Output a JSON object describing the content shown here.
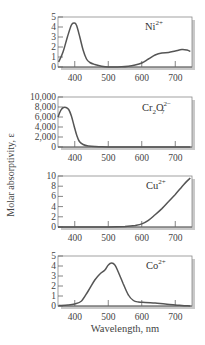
{
  "figure": {
    "ylabel": "Molar absorptivity, ε",
    "xlabel": "Wavelength, nm"
  },
  "chart_data": [
    {
      "type": "line",
      "title": "Ni2+",
      "label_main": "Ni",
      "label_sup": "2+",
      "label_sub": "",
      "xlabel": "Wavelength, nm",
      "ylabel": "Molar absorptivity, ε",
      "xlim": [
        350,
        750
      ],
      "ylim": [
        0,
        5
      ],
      "xticks": [
        400,
        500,
        600,
        700
      ],
      "yticks": [
        0,
        1,
        2,
        3,
        4,
        5
      ],
      "ytick_labels": [
        "0",
        "1",
        "2",
        "3",
        "4",
        "5"
      ],
      "x": [
        352,
        365,
        378,
        390,
        398,
        405,
        415,
        425,
        435,
        445,
        460,
        480,
        500,
        520,
        540,
        560,
        580,
        600,
        620,
        640,
        660,
        680,
        700,
        720,
        735,
        745
      ],
      "y": [
        0.5,
        1.5,
        3.0,
        4.2,
        4.4,
        4.2,
        3.0,
        1.7,
        0.8,
        0.45,
        0.25,
        0.08,
        0.0,
        0.0,
        0.02,
        0.08,
        0.2,
        0.4,
        0.8,
        1.2,
        1.4,
        1.45,
        1.6,
        1.75,
        1.7,
        1.55
      ]
    },
    {
      "type": "line",
      "title": "Cr2O7 2-",
      "label_main": "Cr",
      "label_sup": "2−",
      "label_sub": "2",
      "label_mid": "O",
      "label_sub2": "7",
      "xlabel": "Wavelength, nm",
      "ylabel": "Molar absorptivity, ε",
      "xlim": [
        350,
        750
      ],
      "ylim": [
        0,
        10000
      ],
      "xticks": [
        400,
        500,
        600,
        700
      ],
      "yticks": [
        0,
        2000,
        4000,
        6000,
        8000,
        10000
      ],
      "ytick_labels": [
        "0",
        "2,000",
        "4,000",
        "6,000",
        "8,000",
        "10,000"
      ],
      "x": [
        350,
        358,
        366,
        374,
        382,
        390,
        398,
        406,
        414,
        425,
        440,
        460,
        480,
        500,
        550,
        600,
        650,
        700,
        745
      ],
      "y": [
        6000,
        7300,
        7900,
        7900,
        7500,
        6200,
        4200,
        2300,
        1100,
        500,
        200,
        80,
        30,
        10,
        0,
        0,
        0,
        0,
        0
      ]
    },
    {
      "type": "line",
      "title": "Cu2+",
      "label_main": "Cu",
      "label_sup": "2+",
      "label_sub": "",
      "xlabel": "Wavelength, nm",
      "ylabel": "Molar absorptivity, ε",
      "xlim": [
        350,
        750
      ],
      "ylim": [
        0,
        10
      ],
      "xticks": [
        400,
        500,
        600,
        700
      ],
      "yticks": [
        0,
        2,
        4,
        6,
        8,
        10
      ],
      "ytick_labels": [
        "0",
        "2",
        "4",
        "6",
        "8",
        "10"
      ],
      "x": [
        350,
        400,
        450,
        500,
        550,
        580,
        600,
        620,
        640,
        660,
        680,
        700,
        720,
        735,
        745
      ],
      "y": [
        0,
        0,
        0,
        0,
        0.1,
        0.3,
        0.6,
        1.3,
        2.4,
        3.6,
        5.0,
        6.4,
        7.9,
        9.0,
        9.6
      ]
    },
    {
      "type": "line",
      "title": "Co2+",
      "label_main": "Co",
      "label_sup": "2+",
      "label_sub": "",
      "xlabel": "Wavelength, nm",
      "ylabel": "Molar absorptivity, ε",
      "xlim": [
        350,
        750
      ],
      "ylim": [
        0,
        5
      ],
      "xticks": [
        400,
        500,
        600,
        700
      ],
      "yticks": [
        0,
        1,
        2,
        3,
        4,
        5
      ],
      "ytick_labels": [
        "0",
        "1",
        "2",
        "3",
        "4",
        "5"
      ],
      "x": [
        352,
        380,
        400,
        420,
        440,
        460,
        475,
        490,
        500,
        510,
        520,
        530,
        545,
        560,
        575,
        590,
        610,
        640,
        670,
        700,
        720,
        745
      ],
      "y": [
        0.05,
        0.1,
        0.2,
        0.5,
        1.5,
        2.6,
        3.2,
        3.6,
        4.1,
        4.3,
        4.1,
        3.4,
        2.2,
        1.1,
        0.55,
        0.4,
        0.35,
        0.3,
        0.2,
        0.1,
        0.05,
        0.0
      ]
    }
  ],
  "panels_layout": [
    {
      "top": 17,
      "bottom": 67
    },
    {
      "top": 97,
      "bottom": 147
    },
    {
      "top": 176,
      "bottom": 227
    },
    {
      "top": 256,
      "bottom": 306
    }
  ]
}
